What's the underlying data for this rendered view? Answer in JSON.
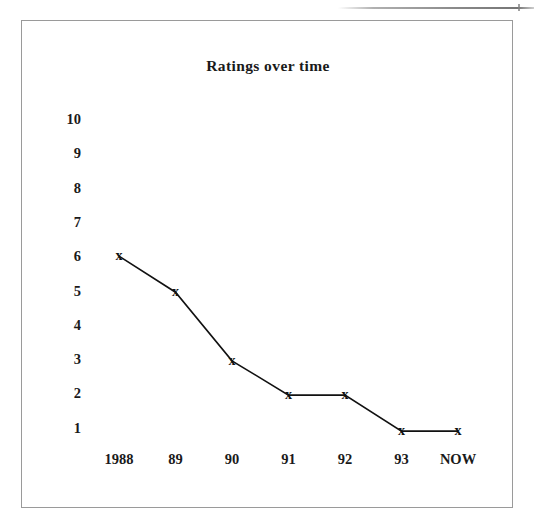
{
  "page": {
    "background_color": "#ffffff",
    "frame_color": "#9a9a9a",
    "ink_color": "#111111"
  },
  "chart_data": {
    "type": "line",
    "title": "Ratings over time",
    "xlabel": "",
    "ylabel": "",
    "categories": [
      "1988",
      "89",
      "90",
      "91",
      "92",
      "93",
      "NOW"
    ],
    "values": [
      6,
      4.95,
      2.95,
      1.95,
      1.95,
      0.9,
      0.9
    ],
    "series": [
      {
        "name": "Ratings",
        "values": [
          6,
          4.95,
          2.95,
          1.95,
          1.95,
          0.9,
          0.9
        ]
      }
    ],
    "ylim": [
      0,
      10
    ],
    "y_ticks": [
      "10",
      "9",
      "8",
      "7",
      "6",
      "5",
      "4",
      "3",
      "2",
      "1"
    ],
    "y_tick_values": [
      10,
      9,
      8,
      7,
      6,
      5,
      4,
      3,
      2,
      1
    ],
    "grid": false,
    "legend": false,
    "marker": "x",
    "line_color": "#111111",
    "marker_color": "#111111"
  }
}
